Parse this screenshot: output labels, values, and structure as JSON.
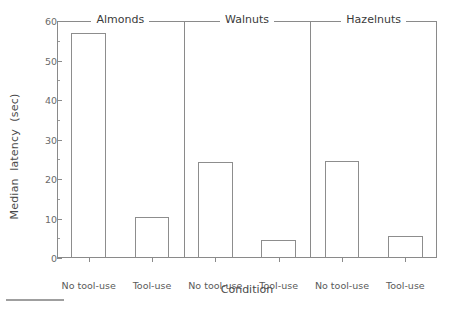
{
  "chart_data": {
    "type": "bar",
    "title": "",
    "xlabel": "Condition",
    "ylabel": "Median  latency  (sec)",
    "ylim": [
      0,
      60
    ],
    "yticks": [
      0,
      10,
      20,
      30,
      40,
      50,
      60
    ],
    "ytick_labels": [
      "0",
      "10",
      "20",
      "30",
      "40",
      "50",
      "60"
    ],
    "yminor_ticks": [
      5,
      15,
      25,
      35,
      45,
      55
    ],
    "grid": false,
    "legend": null,
    "facet_labels": [
      "Almonds",
      "Walnuts",
      "Hazelnuts"
    ],
    "categories": [
      "No tool-use",
      "Tool-use"
    ],
    "panels": [
      {
        "label": "Almonds",
        "bars": [
          {
            "category": "No tool-use",
            "value": 57.0
          },
          {
            "category": "Tool-use",
            "value": 10.3
          }
        ]
      },
      {
        "label": "Walnuts",
        "bars": [
          {
            "category": "No tool-use",
            "value": 24.3
          },
          {
            "category": "Tool-use",
            "value": 4.5
          }
        ]
      },
      {
        "label": "Hazelnuts",
        "bars": [
          {
            "category": "No tool-use",
            "value": 24.5
          },
          {
            "category": "Tool-use",
            "value": 5.5
          }
        ]
      }
    ],
    "bar_style": {
      "fill": "none",
      "edge_color": "#8d8d8d"
    },
    "axis_color": "#8a8a8a",
    "text_color": "#3a3a3a"
  }
}
